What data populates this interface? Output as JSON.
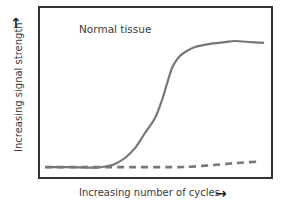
{
  "chart_data": {
    "type": "line",
    "title": "",
    "annotation": "Normal tissue",
    "xlabel": "Increasing number of cycles",
    "ylabel": "Increasing signal strength",
    "xlabel_arrow": "→",
    "ylabel_arrow": "↑",
    "xlim": [
      0,
      100
    ],
    "ylim": [
      0,
      100
    ],
    "x_ticks": [],
    "y_ticks": [],
    "grid": false,
    "legend": "none",
    "colors": {
      "frame": "#333333",
      "curve": "#777777",
      "text": "#3a3a3a"
    },
    "series": [
      {
        "name": "Normal tissue signal",
        "style": "solid",
        "x": [
          2.6,
          13.3,
          24.0,
          29.6,
          32.6,
          36.9,
          41.2,
          45.5,
          49.8,
          52.8,
          55.4,
          57.1,
          59.7,
          62.7,
          67.0,
          73.4,
          79.8,
          84.1,
          90.6,
          96.6
        ],
        "y": [
          6.4,
          6.4,
          6.1,
          7.0,
          8.2,
          11.7,
          17.5,
          26.3,
          35.1,
          45.6,
          57.3,
          64.3,
          70.2,
          73.7,
          76.6,
          78.4,
          79.5,
          80.1,
          79.5,
          79.0
        ]
      },
      {
        "name": "Background signal",
        "style": "dashed",
        "x": [
          2.6,
          20.0,
          40.0,
          60.0,
          65.0,
          75.0,
          85.0,
          94.0
        ],
        "y": [
          6.4,
          6.4,
          6.4,
          6.4,
          6.6,
          7.6,
          8.8,
          9.6
        ]
      }
    ]
  }
}
